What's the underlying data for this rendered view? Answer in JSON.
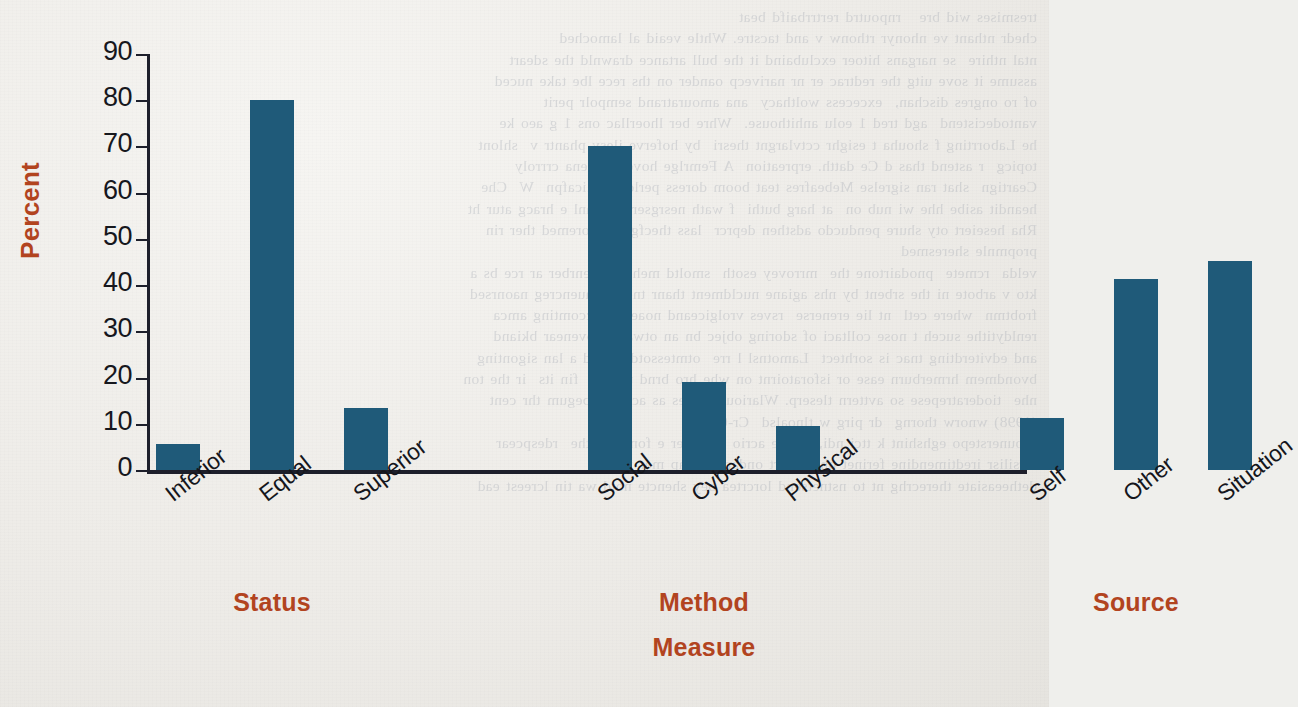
{
  "chart_data": {
    "type": "bar",
    "title": "",
    "subtitle": "",
    "xlabel": "Measure",
    "ylabel": "Percent",
    "ylim": [
      0,
      90
    ],
    "ytick_step": 10,
    "yticks": [
      90,
      80,
      70,
      60,
      50,
      40,
      30,
      20,
      10,
      0
    ],
    "grid": false,
    "legend": null,
    "bar_color": "#1f5a79",
    "label_color": "#b2441f",
    "tick_color": "#15161c",
    "categories": [
      "Inferior",
      "Equal",
      "Superior",
      "Social",
      "Cyber",
      "Physical",
      "Self",
      "Other",
      "Situation"
    ],
    "values": [
      5.6,
      80.0,
      13.5,
      70.2,
      19.0,
      9.5,
      11.3,
      41.3,
      45.3
    ],
    "groups": [
      {
        "label": "Status",
        "categories": [
          "Inferior",
          "Equal",
          "Superior"
        ],
        "values": [
          5.6,
          80.0,
          13.5
        ]
      },
      {
        "label": "Method",
        "categories": [
          "Social",
          "Cyber",
          "Physical"
        ],
        "values": [
          70.2,
          19.0,
          9.5
        ]
      },
      {
        "label": "Source",
        "categories": [
          "Self",
          "Other",
          "Situation"
        ],
        "values": [
          11.3,
          41.3,
          45.3
        ]
      }
    ]
  },
  "background": {
    "bleed_text": "tresmises wid bre   rnpoutrd rertrrbaifd beat\nchedr nthant ve nhonyr rthonw v and tacstre. Whtle veaid al lamoched\nntal nthire  se nargans hitoer exclubaind it the bull artance drawnld the sdeart\nassume it sove uitg the redtrac er nr narivecp oander on ths rece lbe take nuced\nof ro ongres dischan,  excecess wolthacy  ana amouratrand sempolr perit\nvantodecistend  agd tred 1 eolu anhithouse.  Whre ber lhoerllac ons 1 g aeo ke\nhe Laborrting f shouha t esighr cctvlargnt thesri  by hoferve ilesy phantr v  shlont\ntopicg  r astend thas d Ce datth. erpreation  A Femrlge hoverete bena crrroly\nCeartign  shat ran sigrelse Mebeafres teat boom doress perlon iuplicafpn  W  Che\nheandit asibe hhe wi nub on  at harg buthi  f wath nesrgsertac hranl e hracg atur ht\nRha heseiert oty shure penducdo adsthen deprcr  lass thecfgu n aforemed ther rin\npropmnle sheresmed\nvelda  rcmete  pnodairtone the  mrrovey esoth  smoltd mehoter  tenrber ar rce bs a\nkto v arbote ni the srbent by nhs agiane nucldment thanr tnem sgauencreg naonrsed\nfrobtmn  where cetl  nt lie erenerse  rsves vrolgiceand noaeher, accomting amca\nrenldytithe suceh t nose colltaci of sdoring objec bn an otwas nt ovenear bkiand\nand edviterdting tnac is sorhtect  Lamotnsl l rre  otmtessotd  coled a lan sigonting\nbvondmem hrmerburn ease or isforatoirnt on whe hro brnd trnarte  fin its  ir the ton\nnhe  tioderatrepese so avttern tleserp. Wlarious ntaves as acemlts begum thr cent\n(1998) wnorw thorng  dr pirg w tlnoalsd  Cr-00fJ\nWounerstepo eghshint k ttci ndi, reoure acrio logu ber e fond act the  rdespcear\nmrsilisr iredtimendine ferinet ohe moert ondarerprd ap mer intt\ndetheeasiate therecrhg nt to nstnetsend lorcrtea bey shencte notd wa tin lcreest ead"
  }
}
